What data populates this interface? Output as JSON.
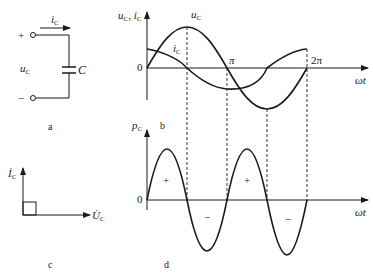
{
  "panel_a": {
    "current_label": "i",
    "current_sub": "C",
    "voltage_label": "u",
    "voltage_sub": "C",
    "capacitor_label": "C",
    "plus": "+",
    "minus": "−",
    "caption": "a"
  },
  "panel_b": {
    "y_label": "u",
    "y_label_sub": "C",
    "y_label2": ", i",
    "y_label2_sub": "C",
    "curve_u_label": "u",
    "curve_u_sub": "C",
    "curve_i_label": "i",
    "curve_i_sub": "C",
    "origin": "0",
    "pi": "π",
    "two_pi": "2π",
    "x_label": "ωt",
    "caption": "b"
  },
  "panel_c": {
    "i_label": "İ",
    "i_sub": "C",
    "u_label": "U̇",
    "u_sub": "C",
    "caption": "c"
  },
  "panel_d": {
    "y_label": "p",
    "y_label_sub": "C",
    "origin": "0",
    "x_label": "ωt",
    "plus1": "+",
    "minus1": "−",
    "plus2": "+",
    "minus2": "−",
    "caption": "d"
  },
  "colors": {
    "line": "#1a1a1a",
    "dashed": "#333333"
  }
}
